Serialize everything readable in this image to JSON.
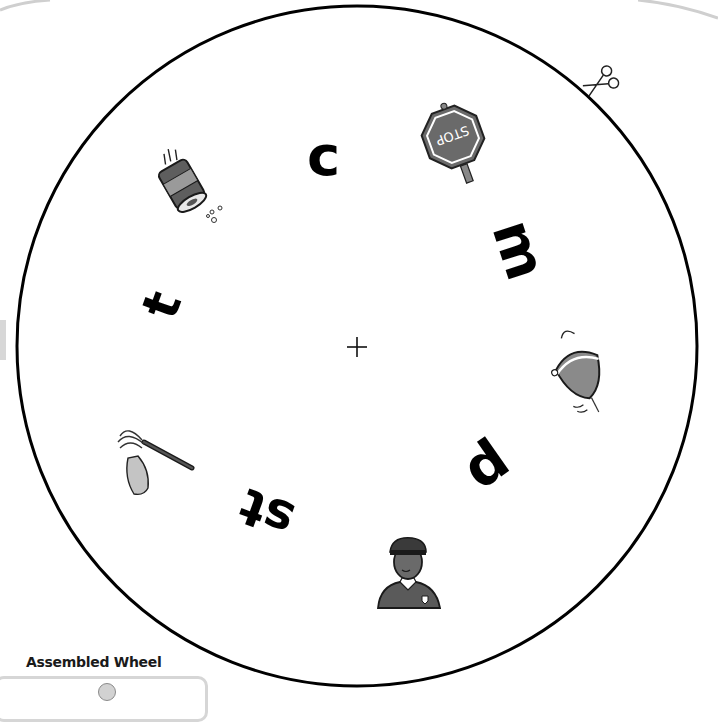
{
  "wheel": {
    "caption": "Assembled Wheel",
    "center_mark": "+",
    "outline_color": "#000000",
    "fill_color": "#ffffff",
    "picture_gray": "#6e6e6e",
    "letters": [
      {
        "text": "c",
        "x": 330,
        "y": 166,
        "rotate": 0,
        "size": 56
      },
      {
        "text": "m",
        "x": 522,
        "y": 256,
        "rotate": 72,
        "size": 56
      },
      {
        "text": "p",
        "x": 490,
        "y": 478,
        "rotate": 145,
        "size": 56
      },
      {
        "text": "st",
        "x": 270,
        "y": 514,
        "rotate": 200,
        "size": 50
      },
      {
        "text": "t",
        "x": 166,
        "y": 306,
        "rotate": 290,
        "size": 50
      }
    ],
    "pictures": [
      {
        "name": "stop-sign",
        "label": "STOP"
      },
      {
        "name": "mop"
      },
      {
        "name": "spinning-top"
      },
      {
        "name": "police-officer"
      },
      {
        "name": "can"
      }
    ],
    "cut_icon": "scissors-icon"
  }
}
